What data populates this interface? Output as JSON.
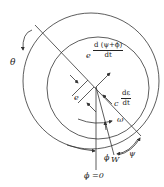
{
  "diagram": {
    "type": "journal-bearing-geometry",
    "labels": {
      "theta": "θ",
      "e": "e",
      "e_prefix": "e",
      "e_term_num": "d (ψ+ϕ)",
      "e_term_den": "dt",
      "c_prefix": "c",
      "c_term_num": "dε",
      "c_term_den": "dt",
      "omega": "ω",
      "phi": "ϕ",
      "W": "W",
      "psi": "ψ",
      "phi_zero": "ϕ =0"
    },
    "colors": {
      "line": "#333333",
      "text": "#222222",
      "background": "#ffffff"
    }
  }
}
